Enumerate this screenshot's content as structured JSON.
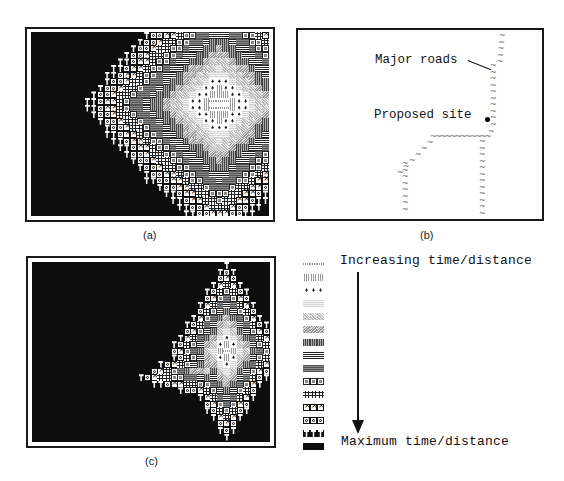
{
  "figure": {
    "panels": {
      "a": {
        "caption": "(a)",
        "frame": {
          "x": 25,
          "y": 27,
          "w": 250,
          "h": 195
        },
        "inner": {
          "x": 31,
          "y": 32,
          "w": 238,
          "h": 184
        },
        "map": {
          "cols": 36,
          "rows": 28,
          "cell": 6.6,
          "center_col": 28,
          "center_row": 10.5,
          "rx": 1.0,
          "ry": 1.0,
          "shape": "diamond-round",
          "max_level": 14
        }
      },
      "b": {
        "caption": "(b)",
        "frame": {
          "x": 296,
          "y": 28,
          "w": 248,
          "h": 193
        },
        "labels": {
          "major_roads": "Major roads",
          "proposed_site": "Proposed site"
        },
        "road_glyph": "~"
      },
      "c": {
        "caption": "(c)",
        "frame": {
          "x": 26,
          "y": 256,
          "w": 250,
          "h": 192
        },
        "inner": {
          "x": 32,
          "y": 262,
          "w": 238,
          "h": 180
        },
        "map": {
          "cols": 36,
          "rows": 27,
          "cell": 6.6,
          "center_col": 30,
          "center_row": 13,
          "rx": 0.55,
          "ry": 1.0,
          "shape": "road-diamond",
          "max_level": 14
        }
      }
    },
    "legend": {
      "top_label": "Increasing time/distance",
      "bottom_label": "Maximum time/distance",
      "arrow": "down-arrow",
      "levels": [
        {
          "level": 0,
          "pattern": "light wavy"
        },
        {
          "level": 1,
          "pattern": "stars"
        },
        {
          "level": 2,
          "pattern": "arrowheads"
        },
        {
          "level": 3,
          "pattern": "light stripes"
        },
        {
          "level": 4,
          "pattern": "light hatching"
        },
        {
          "level": 5,
          "pattern": "medium hatching"
        },
        {
          "level": 6,
          "pattern": "dark vertical stripes"
        },
        {
          "level": 7,
          "pattern": "horizontal lines"
        },
        {
          "level": 8,
          "pattern": "dark horizontal stripes"
        },
        {
          "level": 9,
          "pattern": "boxed squares"
        },
        {
          "level": 10,
          "pattern": "hash marks"
        },
        {
          "level": 11,
          "pattern": "boxed crosses"
        },
        {
          "level": 12,
          "pattern": "boxed circles"
        },
        {
          "level": 13,
          "pattern": "spade marks"
        },
        {
          "level": 14,
          "pattern": "solid black"
        }
      ]
    }
  }
}
